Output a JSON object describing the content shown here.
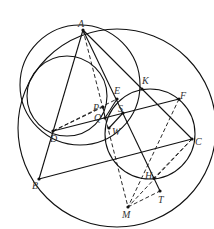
{
  "figure": {
    "type": "geometry-construction",
    "stroke_color": "#111111",
    "label_color": "#333333",
    "points": [
      {
        "name": "A",
        "x": 83,
        "y": 30,
        "lx": 78,
        "ly": 27
      },
      {
        "name": "B",
        "x": 39,
        "y": 179,
        "lx": 32,
        "ly": 189
      },
      {
        "name": "C",
        "x": 192,
        "y": 139,
        "lx": 195,
        "ly": 145
      },
      {
        "name": "D",
        "x": 53,
        "y": 131,
        "lx": 50,
        "ly": 142
      },
      {
        "name": "E",
        "x": 117,
        "y": 99,
        "lx": 114,
        "ly": 94
      },
      {
        "name": "K",
        "x": 142,
        "y": 89,
        "lx": 142,
        "ly": 84
      },
      {
        "name": "F",
        "x": 179,
        "y": 99,
        "lx": 180,
        "ly": 99
      },
      {
        "name": "P",
        "x": 103,
        "y": 107,
        "lx": 93,
        "ly": 111
      },
      {
        "name": "Q",
        "x": 105,
        "y": 118,
        "lx": 94,
        "ly": 121
      },
      {
        "name": "S",
        "x": 123,
        "y": 113,
        "lx": 118,
        "ly": 112
      },
      {
        "name": "W",
        "x": 109,
        "y": 128,
        "lx": 112,
        "ly": 135
      },
      {
        "name": "H",
        "x": 154,
        "y": 178,
        "lx": 145,
        "ly": 179
      },
      {
        "name": "T",
        "x": 160,
        "y": 191,
        "lx": 158,
        "ly": 203
      },
      {
        "name": "M",
        "x": 128,
        "y": 207,
        "lx": 122,
        "ly": 218
      }
    ],
    "circles": [
      {
        "name": "circumcircle-ABC",
        "cx": 117,
        "cy": 128,
        "r": 99
      },
      {
        "name": "circle-A-D-E",
        "cx": 80,
        "cy": 85,
        "r": 60
      },
      {
        "name": "circle-D-Q-E",
        "cx": 67,
        "cy": 96,
        "r": 40
      },
      {
        "name": "circle-K-C-H",
        "cx": 150,
        "cy": 134,
        "r": 45
      }
    ],
    "solid_segments": [
      [
        "A",
        "B"
      ],
      [
        "A",
        "C"
      ],
      [
        "B",
        "C"
      ],
      [
        "D",
        "F"
      ],
      [
        "A",
        "T"
      ],
      [
        "E",
        "Q"
      ],
      [
        "S",
        "W"
      ]
    ],
    "dashed_segments": [
      [
        "A",
        "M"
      ],
      [
        "D",
        "E"
      ],
      [
        "D",
        "P"
      ],
      [
        "F",
        "M"
      ],
      [
        "C",
        "M"
      ],
      [
        "M",
        "T"
      ],
      [
        "C",
        "H"
      ],
      [
        "P",
        "Q"
      ]
    ]
  }
}
